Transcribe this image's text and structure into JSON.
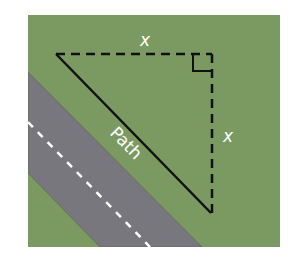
{
  "diagram": {
    "colors": {
      "background": "#ffffff",
      "grass": "#7a9a62",
      "road": "#77777d",
      "road_edge": "#5f6b55",
      "road_marking": "#ffffff",
      "lines": "#111111",
      "label": "#ffffff"
    },
    "labels": {
      "top_side": "x",
      "right_side": "x",
      "hypotenuse": "Path"
    },
    "elements": {
      "grass_area": "grass field",
      "road": "road with dashed center line",
      "hypotenuse": "solid diagonal path line",
      "top_leg": "dashed horizontal side",
      "right_leg": "dashed vertical side",
      "right_angle_marker": "right angle square"
    }
  }
}
